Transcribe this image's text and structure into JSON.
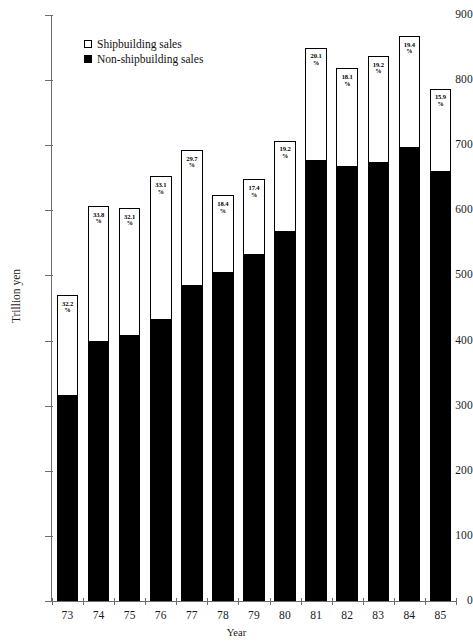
{
  "chart_data": {
    "type": "bar",
    "stacked": true,
    "title": "",
    "xlabel": "Year",
    "ylabel": "Trillion yen",
    "ylim": [
      0,
      900
    ],
    "ytick_step": 100,
    "yticks": [
      "900",
      "800",
      "700",
      "600",
      "500",
      "400",
      "300",
      "200",
      "100",
      "0"
    ],
    "grid": false,
    "legend_position": "top-left-inside",
    "categories": [
      "73",
      "74",
      "75",
      "76",
      "77",
      "78",
      "79",
      "80",
      "81",
      "82",
      "83",
      "84",
      "85"
    ],
    "series": [
      {
        "name": "Non-shipbuilding sales",
        "color": "#000000",
        "values": [
          319,
          402,
          410,
          436,
          487,
          508,
          535,
          571,
          679,
          670,
          676,
          700,
          662
        ]
      },
      {
        "name": "Shipbuilding sales",
        "color": "#ffffff",
        "values": [
          151,
          205,
          194,
          216,
          206,
          115,
          113,
          136,
          171,
          148,
          161,
          168,
          125
        ]
      }
    ],
    "totals": [
      470,
      607,
      604,
      652,
      693,
      623,
      648,
      707,
      850,
      818,
      837,
      868,
      787
    ],
    "annotations": [
      {
        "category": "73",
        "value": "32.2",
        "symbol": "%"
      },
      {
        "category": "74",
        "value": "33.8",
        "symbol": "%"
      },
      {
        "category": "75",
        "value": "32.1",
        "symbol": "%"
      },
      {
        "category": "76",
        "value": "33.1",
        "symbol": "%"
      },
      {
        "category": "77",
        "value": "29.7",
        "symbol": "%"
      },
      {
        "category": "78",
        "value": "18.4",
        "symbol": "%"
      },
      {
        "category": "79",
        "value": "17.4",
        "symbol": "%"
      },
      {
        "category": "80",
        "value": "19.2",
        "symbol": "%"
      },
      {
        "category": "81",
        "value": "20.1",
        "symbol": "%"
      },
      {
        "category": "82",
        "value": "18.1",
        "symbol": "%"
      },
      {
        "category": "83",
        "value": "19.2",
        "symbol": "%"
      },
      {
        "category": "84",
        "value": "19.4",
        "symbol": "%"
      },
      {
        "category": "85",
        "value": "15.9",
        "symbol": "%"
      }
    ]
  },
  "legend": {
    "items": [
      {
        "label": "Shipbuilding sales",
        "swatch": "hollow"
      },
      {
        "label": "Non-shipbuilding sales",
        "swatch": "filled"
      }
    ]
  },
  "axes": {
    "y_title": "Trillion yen",
    "x_title": "Year"
  }
}
